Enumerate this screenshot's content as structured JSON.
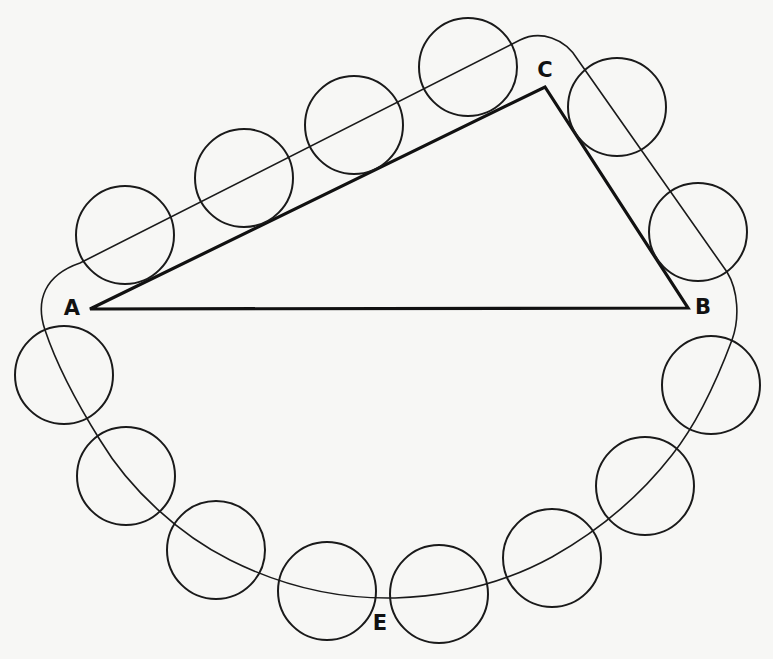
{
  "diagram": {
    "colors": {
      "background": "#f7f7f5",
      "ink": "#111111"
    },
    "labels": [
      {
        "id": "A",
        "text": "A",
        "x": 72,
        "y": 308
      },
      {
        "id": "B",
        "text": "B",
        "x": 703,
        "y": 307
      },
      {
        "id": "C",
        "text": "C",
        "x": 545,
        "y": 70
      },
      {
        "id": "E",
        "text": "E",
        "x": 380,
        "y": 623
      }
    ],
    "triangle": {
      "vertices": {
        "A": [
          90,
          309
        ],
        "B": [
          688,
          308
        ],
        "C": [
          545,
          87
        ]
      }
    },
    "circle_radius": 49,
    "circles": [
      {
        "cx": 125,
        "cy": 235
      },
      {
        "cx": 244,
        "cy": 178
      },
      {
        "cx": 354,
        "cy": 125
      },
      {
        "cx": 468,
        "cy": 67
      },
      {
        "cx": 617,
        "cy": 107
      },
      {
        "cx": 698,
        "cy": 232
      },
      {
        "cx": 711,
        "cy": 385
      },
      {
        "cx": 645,
        "cy": 486
      },
      {
        "cx": 552,
        "cy": 558
      },
      {
        "cx": 439,
        "cy": 594
      },
      {
        "cx": 327,
        "cy": 591
      },
      {
        "cx": 216,
        "cy": 550
      },
      {
        "cx": 126,
        "cy": 476
      },
      {
        "cx": 64,
        "cy": 375
      }
    ]
  }
}
